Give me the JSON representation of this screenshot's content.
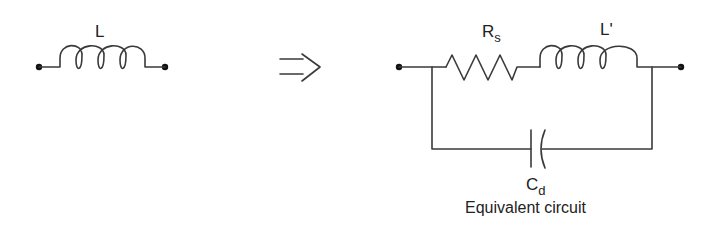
{
  "diagram": {
    "left": {
      "component": "inductor",
      "label": "L"
    },
    "arrow": {
      "symbol": "implies-arrow"
    },
    "right": {
      "resistor": {
        "label_main": "R",
        "label_sub": "s"
      },
      "inductor": {
        "label": "L'"
      },
      "capacitor": {
        "label_main": "C",
        "label_sub": "d"
      },
      "caption": "Equivalent circuit"
    },
    "colors": {
      "line": "#3a3a3a",
      "text": "#222222",
      "background": "#ffffff"
    }
  }
}
